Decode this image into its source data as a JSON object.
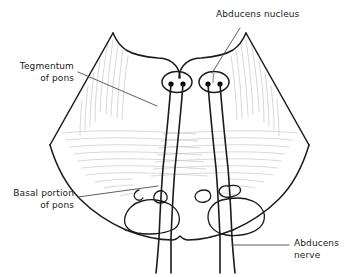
{
  "figure": {
    "type": "anatomical-line-drawing",
    "background_color": "#ffffff",
    "outline_color": "#1a1a1a",
    "striation_color": "#b8b8b8",
    "leader_color": "#555555",
    "nucleus_dot_color": "#000000"
  },
  "labels": {
    "abducens_nucleus": {
      "line1": "Abducens nucleus",
      "line2": ""
    },
    "tegmentum_of_pons": {
      "line1": "Tegmentum",
      "line2": "of pons"
    },
    "basal_portion_of_pons": {
      "line1": "Basal portion",
      "line2": "of pons"
    },
    "abducens_nerve": {
      "line1": "Abducens",
      "line2": "nerve"
    }
  },
  "structures": {
    "nuclei_count": 2,
    "dots_per_nucleus": 2,
    "nerve_fiber_pairs": 4,
    "pontine_blobs": 4
  }
}
